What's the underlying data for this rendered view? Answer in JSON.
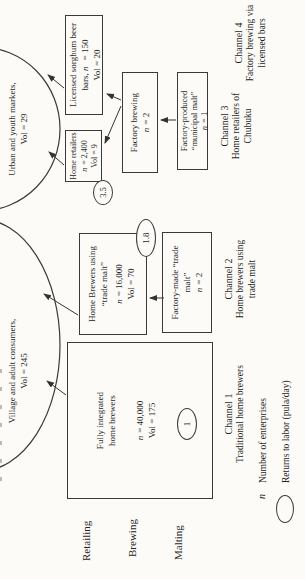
{
  "figure": {
    "n_symbol": "n",
    "rows": {
      "retailing": "Retailing",
      "brewing": "Brewing",
      "malting": "Malting"
    },
    "markets": {
      "village": {
        "name": "Village and adult consumers,",
        "vol": "Vol = 245"
      },
      "urban": {
        "name": "Urban and youth markets,",
        "vol": "Vol = 29"
      }
    },
    "boxes": {
      "ch1": {
        "line1": "Fully integrated",
        "line2": "home brewers",
        "n_val": "= 40,000",
        "vol": "Vol = 175",
        "returns": "1"
      },
      "ch2_brewing": {
        "line1": "Home Brewers using",
        "line2": "“trade malt”",
        "n_val": "= 16,000",
        "vol": "Vol = 70",
        "returns": "1.8"
      },
      "ch2_malting": {
        "line1": "Factory-made “trade",
        "line2": "malt”",
        "n_val": "= 2"
      },
      "ch3_retailing": {
        "line1": "Home retailers",
        "n_val": "= 2,400",
        "vol": "Vol = 9",
        "returns": "3.5"
      },
      "ch3_brewing": {
        "line1": "Factory brewing",
        "n_val": "= 2"
      },
      "ch3_malting": {
        "line1": "Factory-produced",
        "line2": "“municipal malt”",
        "n_val": "= 1"
      },
      "ch4_retailing": {
        "line1": "Licensed sorghum beer",
        "line2_pre": "bars,",
        "line2_post": "= 150",
        "vol": "Vol = 20"
      }
    },
    "channels": [
      {
        "title": "Channel 1",
        "desc1": "Traditional home brewers",
        "desc2": ""
      },
      {
        "title": "Channel 2",
        "desc1": "Home brewers using",
        "desc2": "trade malt"
      },
      {
        "title": "Channel 3",
        "desc1": "Home retailers of",
        "desc2": "Chubuku"
      },
      {
        "title": "Channel 4",
        "desc1": "Factory brewing via",
        "desc2": "licensed bars"
      }
    ],
    "legend": {
      "n_text": "Number of enterprises",
      "returns_text": "Returns to labor (pula/day)"
    },
    "colors": {
      "ink": "#3a3a3a",
      "paper": "#fcfbf8"
    }
  }
}
